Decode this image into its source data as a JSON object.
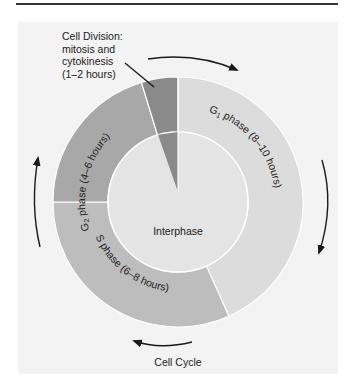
{
  "diagram": {
    "title": "Cell Cycle",
    "center_label": "Interphase",
    "division_label": {
      "lines": [
        "Cell Division:",
        "mitosis and",
        "cytokinesis",
        "(1–2 hours)"
      ]
    },
    "phases": [
      {
        "id": "g1",
        "label_prefix": "G",
        "subscript": "1",
        "label_suffix": " phase (8–10 hours)",
        "start_deg": 0,
        "end_deg": 156,
        "color": "#dcdcdc"
      },
      {
        "id": "s",
        "label_prefix": "S phase (6–8 hours)",
        "subscript": "",
        "label_suffix": "",
        "start_deg": 156,
        "end_deg": 270,
        "color": "#bdbdbd"
      },
      {
        "id": "g2",
        "label_prefix": "G",
        "subscript": "2",
        "label_suffix": " phase (4–6 hours)",
        "start_deg": 270,
        "end_deg": 343,
        "color": "#a8a8a8"
      },
      {
        "id": "m",
        "label_prefix": "",
        "subscript": "",
        "label_suffix": "",
        "start_deg": 343,
        "end_deg": 360,
        "color": "#8a8a8a"
      }
    ],
    "colors": {
      "panel": "#f3f3f3",
      "interphase": "#e4e4e4",
      "divider": "#ffffff",
      "arrow": "#1a1a1a",
      "text": "#222222"
    },
    "arrows_direction": "clockwise"
  }
}
